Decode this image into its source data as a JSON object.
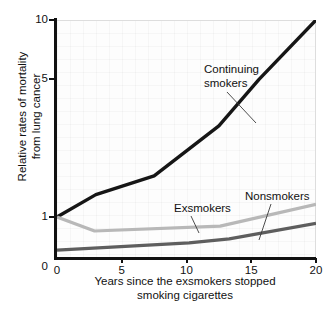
{
  "chart_data": {
    "type": "line",
    "title": "",
    "xlabel_lines": [
      "Years since the exsmokers stopped",
      "smoking cigarettes"
    ],
    "ylabel_lines": [
      "Relative rates of mortality",
      "from lung cancer"
    ],
    "xlabel": "Years since the exsmokers stopped smoking cigarettes",
    "ylabel": "Relative rates of mortality from lung cancer",
    "yscale": "log",
    "xlim": [
      0,
      20
    ],
    "ylim": [
      0.62,
      10
    ],
    "grid": "faint",
    "legend_position": "inline annotations",
    "x_ticks": [
      {
        "value": 0,
        "label": "0"
      },
      {
        "value": 5,
        "label": "5"
      },
      {
        "value": 10,
        "label": "10"
      },
      {
        "value": 15,
        "label": "15"
      },
      {
        "value": 20,
        "label": "20"
      }
    ],
    "y_ticks": [
      {
        "value": 1,
        "label": "1"
      },
      {
        "value": 5,
        "label": "5"
      },
      {
        "value": 10,
        "label": "10"
      }
    ],
    "y_axis_origin_label": "0",
    "series": [
      {
        "name": "Continuing smokers",
        "color": "#161616",
        "width": 3.4,
        "x": [
          0,
          3,
          7.5,
          12.5,
          15.6,
          20
        ],
        "values": [
          1.0,
          1.3,
          1.62,
          2.9,
          5.0,
          10.0
        ]
      },
      {
        "name": "Exsmokers",
        "color": "#b8b8b8",
        "width": 3.2,
        "x": [
          0,
          2.9,
          12.6,
          20
        ],
        "values": [
          1.0,
          0.85,
          0.9,
          1.16
        ]
      },
      {
        "name": "Nonsmokers",
        "color": "#5e5e5e",
        "width": 3.2,
        "x": [
          0,
          10.2,
          13.3,
          20
        ],
        "values": [
          0.68,
          0.74,
          0.775,
          0.93
        ]
      }
    ],
    "annotations": [
      {
        "id": "continuing",
        "text_lines": [
          "Continuing",
          "smokers"
        ],
        "text": "Continuing smokers",
        "target_series": "Continuing smokers"
      },
      {
        "id": "exsmokers",
        "text_lines": [
          "Exsmokers"
        ],
        "text": "Exsmokers",
        "target_series": "Exsmokers"
      },
      {
        "id": "nonsmokers",
        "text_lines": [
          "Nonsmokers"
        ],
        "text": "Nonsmokers",
        "target_series": "Nonsmokers"
      }
    ]
  }
}
